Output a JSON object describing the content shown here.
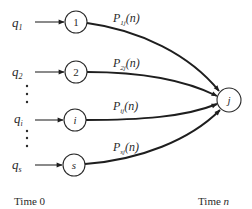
{
  "diagram": {
    "type": "flow-diagram",
    "source_nodes": [
      {
        "id": "1",
        "label": "1",
        "input": "q",
        "input_sub": "1",
        "edge_label": "P",
        "edge_sub": "1j",
        "edge_arg": "(n)"
      },
      {
        "id": "2",
        "label": "2",
        "input": "q",
        "input_sub": "2",
        "edge_label": "P",
        "edge_sub": "2j",
        "edge_arg": "(n)"
      },
      {
        "id": "i",
        "label": "i",
        "input": "q",
        "input_sub": "i",
        "edge_label": "P",
        "edge_sub": "ij",
        "edge_arg": "(n)"
      },
      {
        "id": "s",
        "label": "s",
        "input": "q",
        "input_sub": "s",
        "edge_label": "P",
        "edge_sub": "sj",
        "edge_arg": "(n)"
      }
    ],
    "target_node": {
      "id": "j",
      "label": "j"
    },
    "ellipsis": "⋮",
    "time_start_label": "Time 0",
    "time_end_label_prefix": "Time ",
    "time_end_label_var": "n",
    "colors": {
      "stroke": "#2a2a2a",
      "background": "#ffffff"
    }
  }
}
